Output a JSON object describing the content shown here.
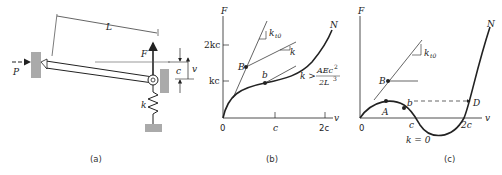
{
  "figure_a": {
    "caption": "(a)",
    "length_label": "L",
    "load_label": "P",
    "force_label": "F",
    "spring_label": "k",
    "gap_label": "c",
    "displacement_label": "v"
  },
  "figure_b": {
    "caption": "(b)",
    "y_axis": "F",
    "x_axis": "v",
    "y_ticks": [
      "2kc",
      "kc"
    ],
    "x_ticks": [
      "0",
      "c",
      "2c"
    ],
    "point_B": "B",
    "point_b": "b",
    "curve_label": "N",
    "tangent_k_t0": "k",
    "tangent_k_t0_sub": "t0",
    "slope_k": "k",
    "condition_lhs": "k >",
    "condition_num": "AEc",
    "condition_num_exp": "2",
    "condition_den": "2L",
    "condition_den_exp": "3"
  },
  "figure_c": {
    "caption": "(c)",
    "y_axis": "F",
    "x_axis": "v",
    "x_ticks": [
      "0",
      "c",
      "2c"
    ],
    "point_A": "A",
    "point_B": "B",
    "point_b": "b",
    "point_D": "D",
    "curve_label": "N",
    "tangent_k_t0": "k",
    "tangent_k_t0_sub": "t0",
    "condition": "k = 0"
  }
}
